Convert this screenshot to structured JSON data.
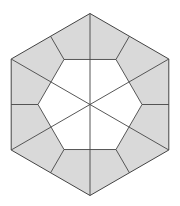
{
  "diagram": {
    "title": "",
    "outer_shape": "regular hexagon (vertex up)",
    "inner_shape": "regular hexagon (flat top)",
    "shaded_regions": 12,
    "diagonals": 3,
    "colors": {
      "shade": "#d9d9d9",
      "line": "#444444",
      "background": "#ffffff",
      "inner": "#ffffff"
    }
  }
}
